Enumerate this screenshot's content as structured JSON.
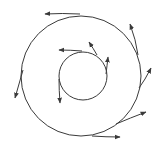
{
  "diagram": {
    "title": "",
    "stroke_color": "#3a3a3a",
    "background": "#ffffff",
    "circles": [
      {
        "name": "outer-circle",
        "cx": 81,
        "cy": 76,
        "r": 60
      },
      {
        "name": "inner-circle",
        "cx": 83,
        "cy": 76,
        "r": 24
      }
    ],
    "arrows": [
      {
        "name": "outer-arrow-top",
        "d": "M 80 14 Q 62 13 45 14",
        "tip": [
          45,
          14
        ],
        "angle": 180
      },
      {
        "name": "outer-arrow-upper-right",
        "d": "M 138 55 Q 136 40 130 24",
        "tip": [
          130,
          24
        ],
        "angle": -110
      },
      {
        "name": "outer-arrow-right",
        "d": "M 139 88 Q 145 80 151 68",
        "tip": [
          151,
          68
        ],
        "angle": -65
      },
      {
        "name": "outer-arrow-lower-right",
        "d": "M 116 124 Q 130 118 146 112",
        "tip": [
          146,
          112
        ],
        "angle": -25
      },
      {
        "name": "outer-arrow-bottom",
        "d": "M 92 136 Q 106 137 120 137",
        "tip": [
          120,
          137
        ],
        "angle": 0
      },
      {
        "name": "outer-arrow-left",
        "d": "M 23 70 Q 19 84 15 98",
        "tip": [
          15,
          98
        ],
        "angle": 105
      },
      {
        "name": "inner-arrow-top",
        "d": "M 82 51 Q 70 50 59 50",
        "tip": [
          59,
          50
        ],
        "angle": 180
      },
      {
        "name": "inner-arrow-upper-right",
        "d": "M 97 55 Q 93 48 89 42",
        "tip": [
          89,
          42
        ],
        "angle": -120
      },
      {
        "name": "inner-arrow-right",
        "d": "M 106 74 Q 107 66 108 57",
        "tip": [
          108,
          57
        ],
        "angle": -85
      },
      {
        "name": "inner-arrow-left",
        "d": "M 59 79 Q 59 90 60 103",
        "tip": [
          60,
          103
        ],
        "angle": 90
      }
    ]
  }
}
